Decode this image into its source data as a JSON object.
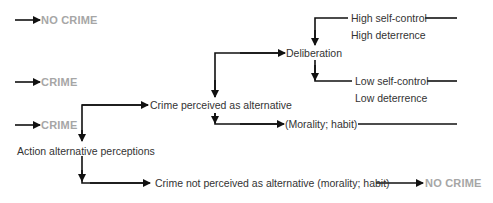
{
  "outcomes": {
    "top": "NO CRIME",
    "middle": "CRIME",
    "lower": "CRIME",
    "bottom_right": "NO CRIME"
  },
  "nodes": {
    "action_alternative": "Action alternative perceptions",
    "crime_perceived": "Crime perceived as alternative",
    "crime_not_perceived": "Crime not perceived as alternative (morality; habit)",
    "deliberation": "Deliberation",
    "morality_habit": "(Morality; habit)",
    "high_self_control": "High self-control",
    "high_deterrence": "High deterrence",
    "low_self_control": "Low self-control",
    "low_deterrence": "Low deterrence"
  },
  "colors": {
    "line": "#111111",
    "text": "#333333",
    "outcome": "#a6a6a6"
  }
}
